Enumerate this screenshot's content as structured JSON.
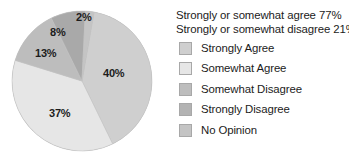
{
  "chart_data": {
    "type": "pie",
    "title": "",
    "categories": [
      "Strongly Agree",
      "Somewhat Agree",
      "Somewhat Disagree",
      "Strongly Disagree",
      "No Opinion"
    ],
    "values": [
      40,
      37,
      13,
      8,
      2
    ],
    "value_labels": [
      "40%",
      "37%",
      "13%",
      "8%",
      "2%"
    ],
    "colors": [
      "#cfcfcf",
      "#e6e6e6",
      "#bdbdbd",
      "#a9a9a9",
      "#c4c4c4"
    ],
    "start_angle_deg": 10,
    "direction": "clockwise",
    "legend_position": "right",
    "grid": false,
    "summary_lines": [
      "Strongly or somewhat agree 77%",
      "Strongly or somewhat disagree 21%"
    ]
  },
  "pie": {
    "slices": [
      {
        "label": "40%",
        "value": 40,
        "category": "Strongly Agree",
        "color": "#cfcfcf",
        "label_x": 103,
        "label_y": 68
      },
      {
        "label": "37%",
        "value": 37,
        "category": "Somewhat Agree",
        "color": "#e6e6e6",
        "label_x": 49,
        "label_y": 108
      },
      {
        "label": "13%",
        "value": 13,
        "category": "Somewhat Disagree",
        "color": "#bdbdbd",
        "label_x": 35,
        "label_y": 48
      },
      {
        "label": "8%",
        "value": 8,
        "category": "Strongly Disagree",
        "color": "#a9a9a9",
        "label_x": 50,
        "label_y": 27
      },
      {
        "label": "2%",
        "value": 2,
        "category": "No Opinion",
        "color": "#c4c4c4",
        "label_x": 76,
        "label_y": 12
      }
    ]
  },
  "legend": {
    "header_line_1": "Strongly or somewhat agree 77%",
    "header_line_2": "Strongly or somewhat disagree 21%",
    "items": [
      {
        "label": "Strongly Agree",
        "color": "#cfcfcf"
      },
      {
        "label": "Somewhat Agree",
        "color": "#e6e6e6"
      },
      {
        "label": "Somewhat Disagree",
        "color": "#bdbdbd"
      },
      {
        "label": "Strongly Disagree",
        "color": "#b3b3b3"
      },
      {
        "label": "No Opinion",
        "color": "#c4c4c4"
      }
    ]
  },
  "colors": {
    "text": "#1b1b1b",
    "background": "#ffffff",
    "swatch_border": "#a8a8a8",
    "pie_rim": "#9a9a9a"
  }
}
